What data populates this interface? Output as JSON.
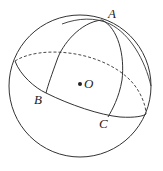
{
  "figure": {
    "type": "sphere-with-great-circles",
    "labels": {
      "A": "A",
      "B": "B",
      "C": "C",
      "O": "O"
    },
    "colors": {
      "stroke": "#333333",
      "background": "#ffffff"
    }
  }
}
